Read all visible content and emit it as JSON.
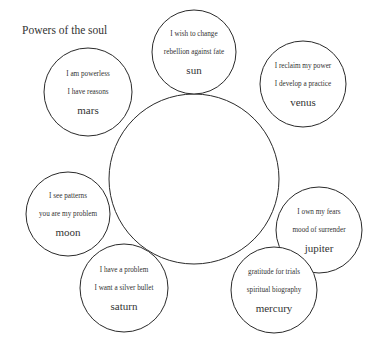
{
  "title": "Powers of the soul",
  "center": {
    "cx": 194,
    "cy": 179,
    "r": 85
  },
  "nodes": [
    {
      "id": "sun",
      "cx": 194,
      "cy": 52,
      "r": 42,
      "lines": [
        "I wish to change",
        "rebellion  against  fate"
      ],
      "planet": "sun"
    },
    {
      "id": "mars",
      "cx": 88,
      "cy": 92,
      "r": 44,
      "lines": [
        "I am  powerless",
        "I have  reasons"
      ],
      "planet": "mars"
    },
    {
      "id": "venus",
      "cx": 303,
      "cy": 84,
      "r": 43,
      "lines": [
        "I reclaim  my power",
        "I develop  a practice"
      ],
      "planet": "venus"
    },
    {
      "id": "moon",
      "cx": 68,
      "cy": 214,
      "r": 42,
      "lines": [
        "I see patterns",
        "you are my problem"
      ],
      "planet": "moon"
    },
    {
      "id": "jupiter",
      "cx": 319,
      "cy": 230,
      "r": 43,
      "lines": [
        "I own  my fears",
        "mood  of surrender"
      ],
      "planet": "jupiter"
    },
    {
      "id": "saturn",
      "cx": 124,
      "cy": 288,
      "r": 44,
      "lines": [
        "I have  a problem",
        "I want  a silver  bullet"
      ],
      "planet": "saturn"
    },
    {
      "id": "mercury",
      "cx": 274,
      "cy": 290,
      "r": 43,
      "lines": [
        "gratitude  for trials",
        "spiritual  biography"
      ],
      "planet": "mercury"
    }
  ],
  "colors": {
    "stroke": "#2a2a2a",
    "text": "#333333",
    "background": "#ffffff"
  }
}
